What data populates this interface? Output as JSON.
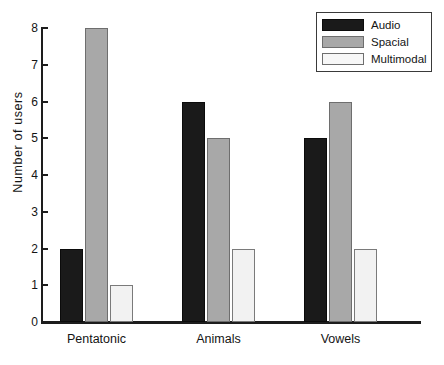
{
  "chart_data": {
    "type": "bar",
    "title": "",
    "xlabel": "",
    "ylabel": "Number  of  users",
    "categories": [
      "Pentatonic",
      "Animals",
      "Vowels"
    ],
    "series": [
      {
        "name": "Audio",
        "values": [
          2,
          6,
          5
        ],
        "color": "#1a1a1a"
      },
      {
        "name": "Spacial",
        "values": [
          8,
          5,
          6
        ],
        "color": "#a8a8a8"
      },
      {
        "name": "Multimodal",
        "values": [
          1,
          2,
          2
        ],
        "color": "#f2f2f2"
      }
    ],
    "ylim": [
      0,
      8
    ],
    "yticks": [
      0,
      1,
      2,
      3,
      4,
      5,
      6,
      7,
      8
    ],
    "ytick_labels": [
      "0",
      "1",
      "2",
      "3",
      "4",
      "5",
      "6",
      "7",
      "8"
    ],
    "grid": false,
    "legend_position": "top-right",
    "legend_entries": [
      "Audio",
      "Spacial",
      "Multimodal"
    ],
    "background": "#ffffff",
    "axis_color": "#1d1d1d"
  }
}
